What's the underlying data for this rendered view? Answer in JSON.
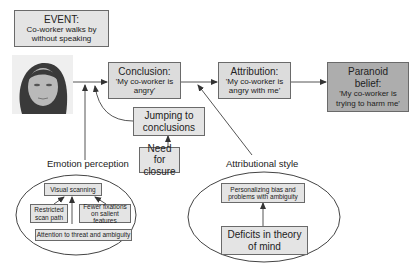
{
  "event": {
    "title": "EVENT:",
    "text": "Co-worker walks by without speaking"
  },
  "photo": {
    "alt": "face-photo"
  },
  "conclusion": {
    "title": "Conclusion:",
    "text": "'My co-worker is angry'"
  },
  "attribution": {
    "title": "Attribution:",
    "text": "'My co-worker is angry with me'"
  },
  "paranoid": {
    "title_line1": "Paranoid",
    "title_line2": "belief:",
    "text": "'My co-worker is trying to harm me'"
  },
  "jumping": {
    "text": "Jumping to conclusions"
  },
  "closure": {
    "text": "Need for closure"
  },
  "emotion_perception": {
    "label": "Emotion perception",
    "visual_scanning": "Visual scanning",
    "restricted": "Restricted scan path",
    "fewer": "Fewer fixations on salient features",
    "attention": "Attention to threat and ambiguity"
  },
  "attributional_style": {
    "label": "Attributional style",
    "personalizing": "Personalizing bias and problems with ambiguity",
    "deficits": "Deficits in theory of mind"
  },
  "colors": {
    "box_fill": "#dcdcdc",
    "dark_fill": "#adadad",
    "stroke": "#6a6a6a",
    "line": "#555555"
  }
}
